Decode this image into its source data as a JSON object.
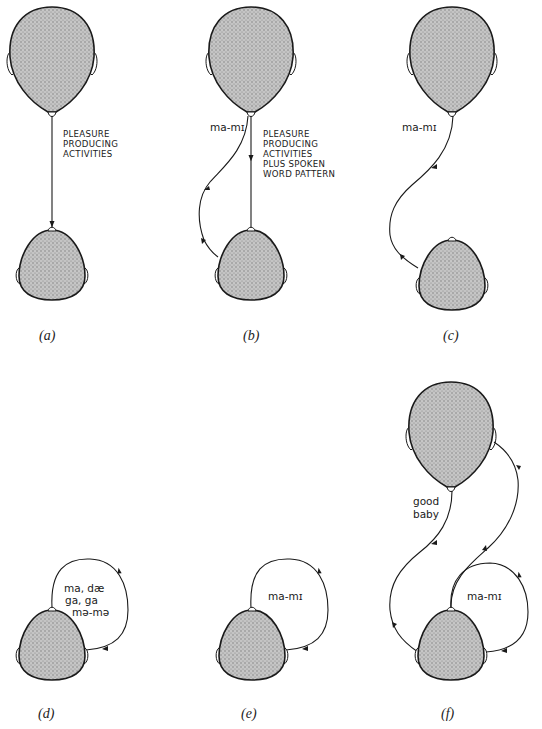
{
  "figure": {
    "colors": {
      "ink": "#1a1a1a",
      "head_fill": "#b8b8b8",
      "background": "#ffffff"
    },
    "panels": [
      {
        "id": "a",
        "label": "(a)",
        "heads": [
          "adult",
          "baby"
        ],
        "text_lines": [
          "PLEASURE",
          "PRODUCING",
          "ACTIVITIES"
        ],
        "arrows": [
          "adult-to-baby straight"
        ]
      },
      {
        "id": "b",
        "label": "(b)",
        "heads": [
          "adult",
          "baby"
        ],
        "phonetic": "ma-mɪ",
        "text_lines": [
          "PLEASURE",
          "PRODUCING",
          "ACTIVITIES",
          "PLUS SPOKEN",
          "WORD PATTERN"
        ],
        "arrows": [
          "adult-to-baby straight",
          "adult-mouth-to-baby-ear curved"
        ]
      },
      {
        "id": "c",
        "label": "(c)",
        "heads": [
          "adult",
          "baby"
        ],
        "phonetic": "ma-mɪ",
        "arrows": [
          "adult-mouth-to-baby-ear curved"
        ]
      },
      {
        "id": "d",
        "label": "(d)",
        "heads": [
          "baby"
        ],
        "phonetic_lines": [
          "ma, dæ",
          "ga, ga",
          "mə-mə"
        ],
        "arrows": [
          "baby-mouth-to-own-ear loop"
        ]
      },
      {
        "id": "e",
        "label": "(e)",
        "heads": [
          "baby"
        ],
        "phonetic": "ma-mɪ",
        "arrows": [
          "baby-mouth-to-own-ear loop"
        ]
      },
      {
        "id": "f",
        "label": "(f)",
        "heads": [
          "adult",
          "baby"
        ],
        "phonetic": "ma-mɪ",
        "text_lines": [
          "good",
          "baby"
        ],
        "arrows": [
          "adult-mouth-to-baby-ear curved",
          "baby-mouth-to-own-ear loop",
          "baby-mouth-to-adult-ear curved"
        ]
      }
    ]
  }
}
